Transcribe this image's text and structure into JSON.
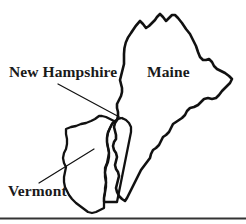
{
  "figure": {
    "type": "line-map",
    "region": "Northern New England",
    "width": 246,
    "height": 224,
    "background_color": "#ffffff",
    "ink_color": "#111111"
  },
  "labels": {
    "new_hampshire": "New Hampshire",
    "maine": "Maine",
    "vermont": "Vermont"
  },
  "leader_lines": [
    {
      "name": "new-hampshire-leader",
      "from": [
        58,
        84
      ],
      "to": [
        123,
        119
      ]
    },
    {
      "name": "vermont-leader",
      "from": [
        39,
        183
      ],
      "to": [
        94,
        149
      ]
    }
  ],
  "outlines": {
    "maine": "M 124 54 C 124 46 127 38 131 33 C 134 28 137 24 140 21 L 143 24 L 146 28 L 149 26 L 152 23 L 155 20 L 157 17 L 160 14 L 163 17 L 166 21 L 169 18 L 172 15 L 175 15 L 178 18 L 182 23 L 186 29 L 190 34 L 193 40 L 196 46 L 198 52 L 200 57 L 203 60 L 206 60 L 209 59 L 212 62 L 214 66 L 217 69 L 221 71 L 225 73 L 229 76 L 232 79 L 230 83 L 226 87 L 222 91 L 219 95 L 216 98 L 212 99 L 208 98 L 204 99 L 201 102 L 198 105 L 194 107 L 190 108 L 187 111 L 185 115 L 182 118 L 179 120 L 176 122 L 173 124 L 171 128 L 169 132 L 166 135 L 163 137 L 161 141 L 159 145 L 156 148 L 153 150 L 151 154 L 150 158 L 147 162 L 144 166 L 141 170 L 139 174 L 137 178 L 135 182 L 133 186 L 131 190 L 129 194 L 127 198 L 125 201 L 122 199 L 119 196 L 117 192 L 116 188 L 117 184 L 118 180 L 119 176 L 118 172 L 116 169 L 115 165 L 116 161 L 117 157 L 116 153 L 114 150 L 113 146 L 114 142 L 116 139 L 116 135 L 115 131 L 114 127 L 115 123 L 117 120 L 118 116 L 118 112 L 117 108 L 117 104 L 119 100 L 121 96 L 122 92 L 122 88 L 121 84 L 120 80 L 121 76 L 122 72 L 123 68 L 124 64 Z",
    "new_hampshire": "M 122 118 L 126 120 L 129 123 L 131 127 L 131 132 L 130 137 L 129 142 L 128 147 L 127 152 L 126 157 L 125 162 L 124 167 L 123 172 L 122 177 L 121 182 L 120 187 L 119 192 L 118 197 L 117 202 L 113 202 L 108 202 L 104 202 L 104 197 L 105 192 L 106 187 L 106 182 L 105 177 L 105 172 L 106 167 L 108 162 L 109 157 L 109 152 L 108 147 L 107 142 L 107 137 L 108 132 L 110 128 L 112 124 L 115 121 L 118 119 Z",
    "vermont": "M 99 116 L 95 119 L 91 121 L 86 123 L 81 124 L 76 126 L 71 127 L 66 129 L 66 134 L 67 139 L 67 144 L 66 149 L 64 153 L 63 158 L 64 163 L 66 167 L 65 172 L 64 177 L 64 182 L 65 187 L 67 191 L 69 195 L 72 199 L 76 203 L 80 206 L 84 209 L 88 212 L 92 213 L 96 212 L 100 210 L 104 208 L 104 203 L 104 198 L 105 193 L 105 188 L 106 183 L 106 178 L 105 173 L 105 168 L 107 163 L 108 158 L 109 153 L 108 148 L 107 143 L 107 138 L 108 133 L 110 128 L 112 124 L 114 121 L 110 119 L 106 117 L 102 116 Z"
  },
  "rule": {
    "name": "bottom-rule",
    "y": 218,
    "x1": 0,
    "x2": 246
  }
}
